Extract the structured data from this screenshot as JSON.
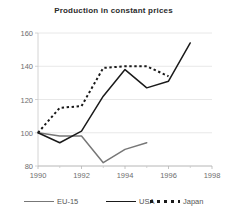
{
  "chart_data": {
    "type": "line",
    "title": "Production in constant prices",
    "xlabel": "",
    "ylabel": "",
    "xlim": [
      1990,
      1998
    ],
    "ylim": [
      80,
      160
    ],
    "yticks": [
      80,
      100,
      120,
      140,
      160
    ],
    "xticks": [
      1990,
      1992,
      1994,
      1996,
      1998
    ],
    "xminor_ticks": [
      1991,
      1993,
      1995,
      1997
    ],
    "grid": "horizontal",
    "legend_position": "bottom",
    "series": [
      {
        "name": "EU-15",
        "style": "solid",
        "color": "#777777",
        "x": [
          1990,
          1991,
          1992,
          1993,
          1994,
          1995
        ],
        "values": [
          100,
          98,
          98,
          82,
          90,
          94
        ]
      },
      {
        "name": "USA",
        "style": "solid",
        "color": "#1a1a1a",
        "x": [
          1990,
          1991,
          1992,
          1993,
          1994,
          1995,
          1996,
          1997
        ],
        "values": [
          100,
          94,
          101,
          122,
          138,
          127,
          131,
          154
        ]
      },
      {
        "name": "Japan",
        "style": "dotted",
        "color": "#1a1a1a",
        "x": [
          1990,
          1991,
          1992,
          1993,
          1994,
          1995,
          1996
        ],
        "values": [
          100,
          115,
          116,
          139,
          140,
          140,
          134
        ]
      }
    ]
  },
  "legend": {
    "items": [
      {
        "label": "EU-15",
        "swatch": "line-gray-solid-swatch"
      },
      {
        "label": "USA",
        "swatch": "line-black-solid-swatch"
      },
      {
        "label": "Japan",
        "swatch": "line-black-dotted-swatch"
      }
    ]
  },
  "axis": {
    "y_labels": [
      "160",
      "140",
      "120",
      "100",
      "80"
    ],
    "x_labels": [
      "1990",
      "1992",
      "1994",
      "1996",
      "1998"
    ]
  }
}
